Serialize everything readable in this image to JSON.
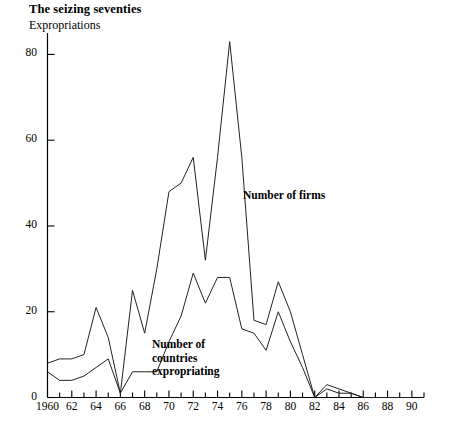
{
  "header": {
    "title": "The seizing seventies",
    "subtitle": "Expropriations"
  },
  "annotations": {
    "firms_label_line1": "Number of firms",
    "countries_label_line1": "Number of",
    "countries_label_line2": "countries",
    "countries_label_line3": "expropriating"
  },
  "colors": {
    "ink": "#000000",
    "background": "#ffffff",
    "line": "#222222"
  },
  "chart_data": {
    "type": "line",
    "title": "The seizing seventies",
    "subtitle": "Expropriations",
    "xlabel": "",
    "ylabel": "",
    "xlim": [
      1960,
      1991
    ],
    "ylim": [
      0,
      85
    ],
    "yticks": [
      0,
      20,
      40,
      60,
      80
    ],
    "ytick_labels": [
      "0",
      "20",
      "40",
      "60",
      "80"
    ],
    "xticks": [
      1960,
      1962,
      1964,
      1966,
      1968,
      1970,
      1972,
      1974,
      1976,
      1978,
      1980,
      1982,
      1984,
      1986,
      1988,
      1990
    ],
    "xtick_labels": [
      "1960",
      "62",
      "64",
      "66",
      "68",
      "70",
      "72",
      "74",
      "76",
      "78",
      "80",
      "82",
      "84",
      "86",
      "88",
      "90"
    ],
    "xtick_minor_interval": 1,
    "grid": false,
    "legend": "inline-annotations",
    "x": [
      1960,
      1961,
      1962,
      1963,
      1964,
      1965,
      1966,
      1967,
      1968,
      1969,
      1970,
      1971,
      1972,
      1973,
      1974,
      1975,
      1976,
      1977,
      1978,
      1979,
      1980,
      1981,
      1982,
      1983,
      1984,
      1985,
      1986,
      1987,
      1988,
      1989,
      1990
    ],
    "series": [
      {
        "name": "Number of firms",
        "values": [
          8,
          9,
          9,
          10,
          21,
          14,
          1,
          25,
          15,
          30,
          48,
          50,
          56,
          32,
          56,
          83,
          56,
          18,
          17,
          27,
          20,
          10,
          0,
          2,
          1,
          1,
          0,
          0,
          0,
          0,
          0
        ]
      },
      {
        "name": "Number of countries expropriating",
        "values": [
          6,
          4,
          4,
          5,
          7,
          9,
          1,
          6,
          6,
          6,
          13,
          19,
          29,
          22,
          28,
          28,
          16,
          15,
          11,
          20,
          13,
          7,
          0,
          3,
          2,
          1,
          0,
          0,
          0,
          0,
          0
        ]
      }
    ]
  }
}
